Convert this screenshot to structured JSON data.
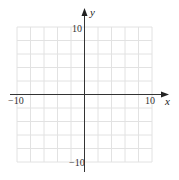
{
  "diagram": {
    "type": "coordinate-grid",
    "x_axis": {
      "label": "x",
      "min_label": "−10",
      "max_label": "10",
      "min": -10,
      "max": 10
    },
    "y_axis": {
      "label": "y",
      "min_label": "−10",
      "max_label": "10",
      "min": -10,
      "max": 10
    },
    "grid": {
      "cells_per_side": 10,
      "step": 2
    },
    "colors": {
      "grid": "#e2e2e2",
      "axis": "#333333"
    }
  }
}
